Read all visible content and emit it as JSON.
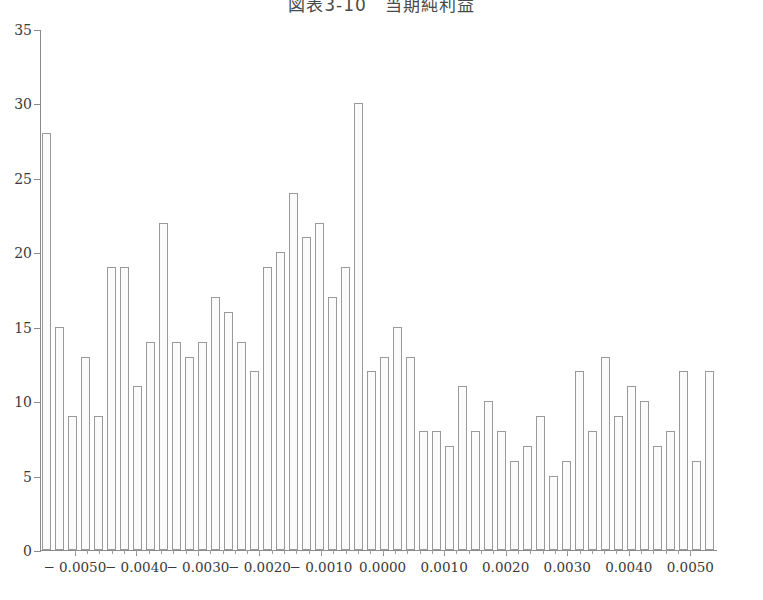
{
  "chart_data": {
    "type": "bar",
    "title": "図表3-10　当期純利益",
    "xlabel": "",
    "ylabel": "",
    "xlim": [
      -0.00555,
      0.00545
    ],
    "ylim": [
      0,
      35
    ],
    "grid": false,
    "legend": null,
    "bin_width": 0.0002,
    "xticks": [
      -0.005,
      -0.004,
      -0.003,
      -0.002,
      -0.001,
      0.0,
      0.001,
      0.002,
      0.003,
      0.004,
      0.005
    ],
    "xticklabels": [
      "− 0.0050",
      "− 0.0040",
      "− 0.0030",
      "− 0.0020",
      "− 0.0010",
      "0.0000",
      "0.0010",
      "0.0020",
      "0.0030",
      "0.0040",
      "0.0050"
    ],
    "yticks": [
      0,
      5,
      10,
      15,
      20,
      25,
      30,
      35
    ],
    "yticklabels": [
      "0",
      "5",
      "10",
      "15",
      "20",
      "25",
      "30",
      "35"
    ],
    "x": [
      -0.00535,
      -0.00515,
      -0.00495,
      -0.00475,
      -0.00455,
      -0.00435,
      -0.00415,
      -0.00395,
      -0.00375,
      -0.00355,
      -0.00335,
      -0.00315,
      -0.00295,
      -0.00275,
      -0.00255,
      -0.00235,
      -0.00215,
      -0.00195,
      -0.00175,
      -0.00155,
      -0.00135,
      -0.00115,
      -0.00095,
      -0.00075,
      -0.00055,
      -0.00035,
      -0.00015,
      5e-05,
      0.00025,
      0.00045,
      0.00065,
      0.00085,
      0.00105,
      0.00125,
      0.00145,
      0.00165,
      0.00185,
      0.00205,
      0.00225,
      0.00245,
      0.00265,
      0.00285,
      0.00305,
      0.00325,
      0.00345,
      0.00365,
      0.00385,
      0.00405,
      0.00425,
      0.00445,
      0.00465,
      0.00485,
      0.00525
    ],
    "values": [
      28,
      15,
      9,
      13,
      9,
      19,
      19,
      11,
      14,
      22,
      14,
      13,
      14,
      17,
      16,
      14,
      12,
      19,
      20,
      24,
      21,
      22,
      17,
      19,
      30,
      12,
      13,
      15,
      13,
      8,
      8,
      7,
      11,
      8,
      10,
      8,
      6,
      7,
      9,
      5,
      6,
      12,
      8,
      13,
      9,
      11,
      10,
      7,
      8,
      12,
      6,
      5,
      12
    ],
    "bars": [
      {
        "value": 28,
        "left_px": 1
      },
      {
        "value": 15,
        "left_px": 14
      },
      {
        "value": 9,
        "left_px": 27
      },
      {
        "value": 13,
        "left_px": 40
      },
      {
        "value": 9,
        "left_px": 53
      },
      {
        "value": 19,
        "left_px": 66
      },
      {
        "value": 19,
        "left_px": 79
      },
      {
        "value": 11,
        "left_px": 92
      },
      {
        "value": 14,
        "left_px": 105
      },
      {
        "value": 22,
        "left_px": 118
      },
      {
        "value": 14,
        "left_px": 131
      },
      {
        "value": 13,
        "left_px": 144
      },
      {
        "value": 14,
        "left_px": 157
      },
      {
        "value": 17,
        "left_px": 170
      },
      {
        "value": 16,
        "left_px": 183
      },
      {
        "value": 14,
        "left_px": 196
      },
      {
        "value": 12,
        "left_px": 209
      },
      {
        "value": 19,
        "left_px": 222
      },
      {
        "value": 20,
        "left_px": 235
      },
      {
        "value": 24,
        "left_px": 248
      },
      {
        "value": 21,
        "left_px": 261
      },
      {
        "value": 22,
        "left_px": 274
      },
      {
        "value": 17,
        "left_px": 287
      },
      {
        "value": 19,
        "left_px": 300
      },
      {
        "value": 30,
        "left_px": 313
      },
      {
        "value": 12,
        "left_px": 326
      },
      {
        "value": 13,
        "left_px": 339
      },
      {
        "value": 15,
        "left_px": 352
      },
      {
        "value": 13,
        "left_px": 365
      },
      {
        "value": 8,
        "left_px": 378
      },
      {
        "value": 8,
        "left_px": 391
      },
      {
        "value": 7,
        "left_px": 404
      },
      {
        "value": 11,
        "left_px": 417
      },
      {
        "value": 8,
        "left_px": 430
      },
      {
        "value": 10,
        "left_px": 443
      },
      {
        "value": 8,
        "left_px": 456
      },
      {
        "value": 6,
        "left_px": 469
      },
      {
        "value": 7,
        "left_px": 482
      },
      {
        "value": 9,
        "left_px": 495
      },
      {
        "value": 5,
        "left_px": 508
      },
      {
        "value": 6,
        "left_px": 521
      },
      {
        "value": 12,
        "left_px": 534
      },
      {
        "value": 8,
        "left_px": 547
      },
      {
        "value": 13,
        "left_px": 560
      },
      {
        "value": 9,
        "left_px": 573
      },
      {
        "value": 11,
        "left_px": 586
      },
      {
        "value": 10,
        "left_px": 599
      },
      {
        "value": 7,
        "left_px": 612
      },
      {
        "value": 8,
        "left_px": 625
      },
      {
        "value": 12,
        "left_px": 638
      },
      {
        "value": 6,
        "left_px": 651
      },
      {
        "value": 5,
        "left_px": 664
      },
      {
        "value": 12,
        "left_px": 664
      }
    ]
  }
}
